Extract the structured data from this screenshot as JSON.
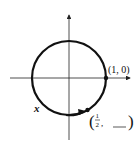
{
  "diagram": {
    "type": "unit-circle",
    "point_start": {
      "label": "(1, 0)"
    },
    "point_end": {
      "label_open": "(",
      "numerator": "1",
      "denominator": "2",
      "comma": ",",
      "blank": "___",
      "label_close": ")"
    },
    "arc_label": "x",
    "colors": {
      "stroke": "#111111",
      "axis": "#222222",
      "background": "#ffffff"
    }
  }
}
